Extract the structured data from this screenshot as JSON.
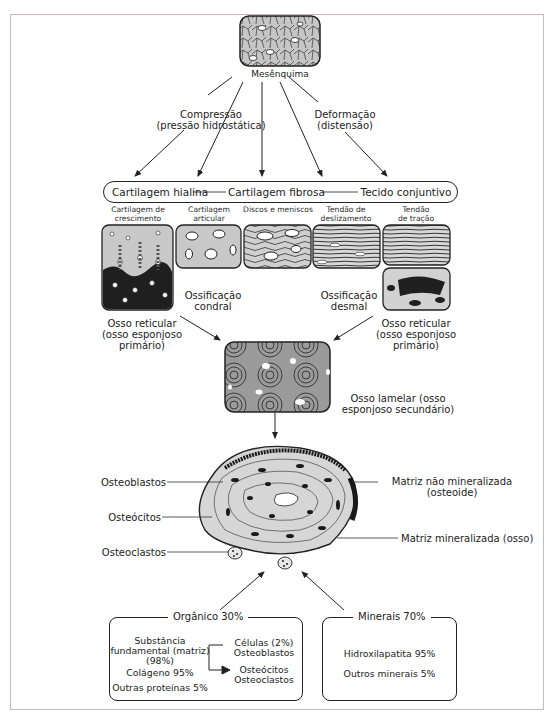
{
  "diagram": {
    "source": {
      "label": "Mesênquima",
      "icon": "mesenchyme-tissue-icon"
    },
    "forces": {
      "left": {
        "line1": "Compressão",
        "line2": "(pressão hidrostática)"
      },
      "right": {
        "line1": "Deformação",
        "line2": "(distensão)"
      }
    },
    "spectrum": {
      "items": [
        "Cartilagem hialina",
        "Cartilagem fibrosa",
        "Tecido conjuntivo"
      ]
    },
    "tissues": [
      {
        "line1": "Cartilagem de",
        "line2": "crescimento",
        "icon": "growth-cartilage-icon"
      },
      {
        "line1": "Cartilagem",
        "line2": "articular",
        "icon": "articular-cartilage-icon"
      },
      {
        "line1": "Discos e meniscos",
        "line2": "",
        "icon": "disc-meniscus-icon"
      },
      {
        "line1": "Tendão de",
        "line2": "deslizamento",
        "icon": "gliding-tendon-icon"
      },
      {
        "line1": "Tendão",
        "line2": "de tração",
        "icon": "traction-tendon-icon"
      }
    ],
    "ossification": {
      "chondral": {
        "line1": "Ossificação",
        "line2": "condral"
      },
      "desmal": {
        "line1": "Ossificação",
        "line2": "desmal"
      }
    },
    "woven_bone": {
      "left": {
        "line1": "Osso reticular",
        "line2": "(osso esponjoso",
        "line3": "primário)"
      },
      "right": {
        "line1": "Osso reticular",
        "line2": "(osso esponjoso",
        "line3": "primário)"
      }
    },
    "lamellar_bone": {
      "line1": "Osso lamelar (osso",
      "line2": "esponjoso secundário)",
      "icon": "lamellar-bone-icon"
    },
    "osteon": {
      "icon": "osteon-cross-section-icon",
      "labels_left": [
        "Osteoblastos",
        "Osteócitos",
        "Osteoclastos"
      ],
      "labels_right": [
        {
          "line1": "Matriz não mineralizada",
          "line2": "(osteoide)"
        },
        {
          "line1": "Matriz mineralizada (osso)",
          "line2": ""
        }
      ]
    },
    "composition": {
      "organic": {
        "title": "Orgânico 30%",
        "matrix": {
          "line1": "Substância",
          "line2": "fundamental (matriz)",
          "line3": "(98%)"
        },
        "collagen": "Colágeno 95%",
        "other_proteins": "Outras proteínas 5%",
        "cells": {
          "line1": "Células (2%)",
          "line2": "Osteoblastos",
          "line3": "Osteócitos",
          "line4": "Osteoclastos"
        }
      },
      "minerals": {
        "title": "Minerais 70%",
        "hydroxyapatite": "Hidroxilapatita 95%",
        "other_minerals": "Outros minerais 5%"
      }
    },
    "colors": {
      "line": "#222222",
      "frame": "#c9b9bf",
      "tissue_fill": "#bdbdbd",
      "tissue_dark": "#2b2b2b"
    }
  }
}
